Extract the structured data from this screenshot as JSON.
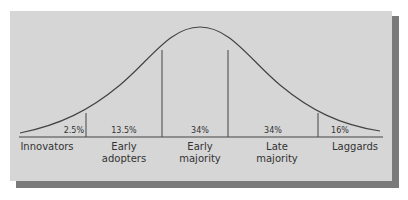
{
  "cutoff_text": "",
  "diagram": {
    "curve": "bell",
    "colors": {
      "panel": "#d6d6d6",
      "shadow": "#7a7a7a",
      "line": "#444444",
      "text": "#333333"
    },
    "segments": [
      {
        "percent": "2.5%",
        "label_line1": "Innovators",
        "label_line2": ""
      },
      {
        "percent": "13.5%",
        "label_line1": "Early",
        "label_line2": "adopters"
      },
      {
        "percent": "34%",
        "label_line1": "Early",
        "label_line2": "majority"
      },
      {
        "percent": "34%",
        "label_line1": "Late",
        "label_line2": "majority"
      },
      {
        "percent": "16%",
        "label_line1": "Laggards",
        "label_line2": ""
      }
    ]
  }
}
